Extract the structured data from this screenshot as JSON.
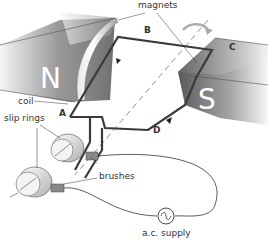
{
  "diagram": {
    "type": "ac-generator",
    "labels": {
      "magnets": "magnets",
      "coil": "coil",
      "slip_rings": "slip rings",
      "brushes": "brushes",
      "supply": "a.c. supply"
    },
    "points": {
      "a": "A",
      "b": "B",
      "c": "C",
      "d": "D"
    },
    "poles": {
      "north": "N",
      "south": "S"
    },
    "colors": {
      "magnet_dark": "#6e6e6e",
      "magnet_light": "#f2f2f2",
      "wire": "#3a3a3a",
      "text": "#333333"
    }
  }
}
